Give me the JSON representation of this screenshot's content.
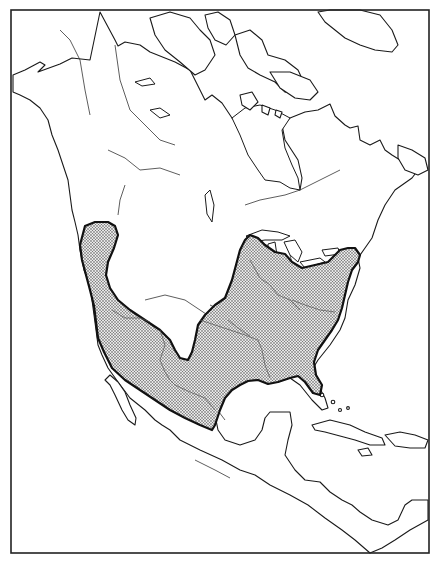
{
  "map": {
    "type": "species-range-map",
    "region": "North America",
    "frame": {
      "x": 11,
      "y": 10,
      "width": 418,
      "height": 543
    },
    "colors": {
      "background": "#ffffff",
      "outline": "#1a1a1a",
      "range_stipple": "#333333",
      "range_boundary": "#111111"
    },
    "legend": [],
    "labels": [],
    "range": {
      "description": "Stippled range covering the contiguous western coast, Great Basin south to Mexico, and eastern/central United States, excluding the northern Great Plains",
      "fill_pattern": "stipple-dots"
    }
  }
}
